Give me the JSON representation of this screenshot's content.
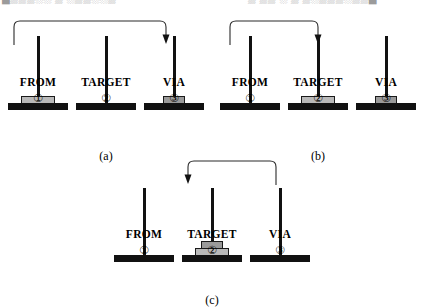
{
  "figure": {
    "clipped_header_left": "█▒▒▒░░ ▒ ░▒▒░░▒",
    "clipped_header_right": "▒ ▒▒  ░ ▒ ▒░▒▒▒░▒▒█",
    "diagram_type": "Tower of Hanoi move sequence",
    "peg_labels": [
      "FROM",
      "TARGET",
      "VIA"
    ],
    "peg_numbers": [
      "①",
      "②",
      "③"
    ],
    "colors": {
      "peg": "#111111",
      "base": "#111111",
      "disk_large": "#b9b9b9",
      "disk_small": "#9a9a9a",
      "arrow": "#2b2b2b",
      "background": "#ffffff"
    },
    "panels": [
      {
        "caption": "(a)",
        "move": {
          "from": "FROM",
          "to": "VIA",
          "direction": "right"
        },
        "pegs": [
          {
            "label": "FROM",
            "number": "①",
            "disks": [
              "large"
            ]
          },
          {
            "label": "TARGET",
            "number": "②",
            "disks": []
          },
          {
            "label": "VIA",
            "number": "③",
            "disks": [
              "small"
            ]
          }
        ]
      },
      {
        "caption": "(b)",
        "move": {
          "from": "FROM",
          "to": "TARGET",
          "direction": "right"
        },
        "pegs": [
          {
            "label": "FROM",
            "number": "①",
            "disks": []
          },
          {
            "label": "TARGET",
            "number": "②",
            "disks": [
              "large"
            ]
          },
          {
            "label": "VIA",
            "number": "③",
            "disks": [
              "small"
            ]
          }
        ]
      },
      {
        "caption": "(c)",
        "move": {
          "from": "VIA",
          "to": "TARGET",
          "direction": "left"
        },
        "pegs": [
          {
            "label": "FROM",
            "number": "①",
            "disks": []
          },
          {
            "label": "TARGET",
            "number": "②",
            "disks": [
              "large",
              "small"
            ]
          },
          {
            "label": "VIA",
            "number": "③",
            "disks": []
          }
        ]
      }
    ]
  }
}
